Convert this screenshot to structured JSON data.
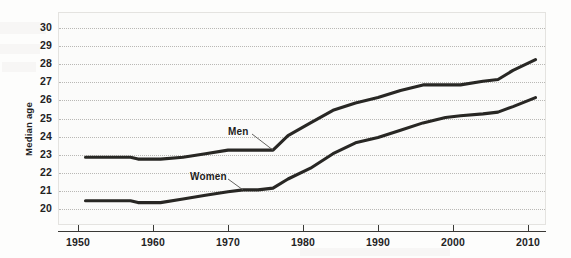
{
  "chart_data": {
    "type": "line",
    "title": "",
    "xlabel": "",
    "ylabel": "Median age",
    "xlim": [
      1950,
      2012
    ],
    "ylim": [
      19.5,
      30.4
    ],
    "grid": true,
    "legend_position": "inline-annotations",
    "x_ticks": [
      "1950",
      "1960",
      "1970",
      "1980",
      "1990",
      "2000",
      "2010"
    ],
    "y_ticks": [
      "20",
      "21",
      "22",
      "23",
      "24",
      "25",
      "26",
      "27",
      "28",
      "29",
      "30"
    ],
    "series": [
      {
        "name": "Men",
        "color": "#282724",
        "x": [
          1951,
          1957,
          1958,
          1961,
          1964,
          1967,
          1970,
          1972,
          1974,
          1976,
          1978,
          1981,
          1984,
          1987,
          1990,
          1993,
          1996,
          1999,
          2001,
          2004,
          2006,
          2008,
          2011
        ],
        "values": [
          22.8,
          22.8,
          22.7,
          22.7,
          22.8,
          23.0,
          23.2,
          23.2,
          23.2,
          23.2,
          24.0,
          24.7,
          25.4,
          25.8,
          26.1,
          26.5,
          26.8,
          26.8,
          26.8,
          27.0,
          27.1,
          27.6,
          28.2
        ]
      },
      {
        "name": "Women",
        "color": "#282724",
        "x": [
          1951,
          1957,
          1958,
          1961,
          1964,
          1967,
          1970,
          1972,
          1974,
          1976,
          1978,
          1981,
          1984,
          1987,
          1990,
          1993,
          1996,
          1999,
          2001,
          2004,
          2006,
          2008,
          2011
        ],
        "values": [
          20.4,
          20.4,
          20.3,
          20.3,
          20.5,
          20.7,
          20.9,
          21.0,
          21.0,
          21.1,
          21.6,
          22.2,
          23.0,
          23.6,
          23.9,
          24.3,
          24.7,
          25.0,
          25.1,
          25.2,
          25.3,
          25.6,
          26.1
        ]
      }
    ],
    "annotations": [
      {
        "label": "Men",
        "series": "Men"
      },
      {
        "label": "Women",
        "series": "Women"
      }
    ]
  }
}
